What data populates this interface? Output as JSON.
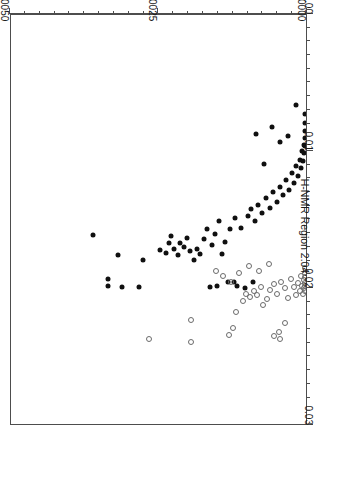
{
  "chart_data": {
    "type": "scatter",
    "title": "",
    "subtitle": "",
    "orientation_note": "figure printed rotated 180 degrees",
    "xlabel": "H-NMR Region 2.77",
    "ylabel": "H-NMR Region 2.04",
    "xlim": [
      0.0,
      0.005
    ],
    "ylim": [
      0.0,
      0.03
    ],
    "x_ticks": [
      0.0,
      0.0025,
      0.005
    ],
    "x_tick_labels": [
      "0.0000",
      "0.0025",
      "0.0050"
    ],
    "y_ticks": [
      0.0,
      0.01,
      0.02,
      0.03
    ],
    "y_tick_labels": [
      "0.00",
      "0.01",
      "0.02",
      "0.03"
    ],
    "x_minor_count": 9,
    "y_minor_count": 9,
    "grid": false,
    "legend": null,
    "series": [
      {
        "name": "filled-circles",
        "marker": "filled circle",
        "color": "#101010",
        "points": [
          [
            0.00333,
            0.0199
          ],
          [
            0.00333,
            0.0194
          ],
          [
            0.00309,
            0.02
          ],
          [
            0.00281,
            0.02
          ],
          [
            0.00161,
            0.02
          ],
          [
            0.00149,
            0.0199
          ],
          [
            0.00131,
            0.0196
          ],
          [
            0.00122,
            0.0196
          ],
          [
            0.00116,
            0.0199
          ],
          [
            0.00102,
            0.0201
          ],
          [
            0.0009,
            0.0196
          ],
          [
            0.00359,
            0.0162
          ],
          [
            0.00317,
            0.0177
          ],
          [
            0.00274,
            0.018
          ],
          [
            0.00246,
            0.0173
          ],
          [
            0.00235,
            0.0175
          ],
          [
            0.0023,
            0.0168
          ],
          [
            0.00228,
            0.0163
          ],
          [
            0.00223,
            0.0172
          ],
          [
            0.00216,
            0.0177
          ],
          [
            0.00212,
            0.0168
          ],
          [
            0.00205,
            0.0171
          ],
          [
            0.002,
            0.0164
          ],
          [
            0.00196,
            0.0174
          ],
          [
            0.00189,
            0.018
          ],
          [
            0.00184,
            0.0172
          ],
          [
            0.00179,
            0.0176
          ],
          [
            0.00172,
            0.0165
          ],
          [
            0.00166,
            0.0158
          ],
          [
            0.00158,
            0.0169
          ],
          [
            0.00154,
            0.0161
          ],
          [
            0.00146,
            0.0152
          ],
          [
            0.00141,
            0.0176
          ],
          [
            0.00136,
            0.0167
          ],
          [
            0.00128,
            0.0158
          ],
          [
            0.00119,
            0.015
          ],
          [
            0.0011,
            0.0157
          ],
          [
            0.00098,
            0.0148
          ],
          [
            0.00093,
            0.0143
          ],
          [
            0.00086,
            0.0152
          ],
          [
            0.0008,
            0.014
          ],
          [
            0.00074,
            0.0146
          ],
          [
            0.00068,
            0.0135
          ],
          [
            0.00061,
            0.0142
          ],
          [
            0.00055,
            0.0131
          ],
          [
            0.00049,
            0.0138
          ],
          [
            0.00043,
            0.0127
          ],
          [
            0.00038,
            0.0133
          ],
          [
            0.00033,
            0.0122
          ],
          [
            0.00029,
            0.0129
          ],
          [
            0.00024,
            0.0117
          ],
          [
            0.0002,
            0.0124
          ],
          [
            0.00016,
            0.0112
          ],
          [
            0.00013,
            0.0119
          ],
          [
            0.0001,
            0.0107
          ],
          [
            8e-05,
            0.0113
          ],
          [
            6e-05,
            0.0101
          ],
          [
            5e-05,
            0.0108
          ],
          [
            4e-05,
            0.0096
          ],
          [
            3e-05,
            0.0102
          ],
          [
            2e-05,
            0.0091
          ],
          [
            2e-05,
            0.0097
          ],
          [
            1e-05,
            0.0086
          ],
          [
            1e-05,
            0.008
          ],
          [
            1e-05,
            0.0074
          ],
          [
            0.00016,
            0.0067
          ],
          [
            0.00085,
            0.0088
          ],
          [
            0.00057,
            0.0083
          ],
          [
            0.00043,
            0.0094
          ],
          [
            0.0007,
            0.011
          ],
          [
            0.00031,
            0.009
          ]
        ]
      },
      {
        "name": "open-circles",
        "marker": "open circle",
        "color": "#6b6b6b",
        "points": [
          [
            0.00264,
            0.0238
          ],
          [
            0.00194,
            0.024
          ],
          [
            0.00194,
            0.0224
          ],
          [
            0.00129,
            0.0235
          ],
          [
            0.00123,
            0.023
          ],
          [
            0.00054,
            0.0236
          ],
          [
            0.00046,
            0.0233
          ],
          [
            0.00043,
            0.0238
          ],
          [
            0.00035,
            0.0226
          ],
          [
            0.00117,
            0.0218
          ],
          [
            0.00106,
            0.021
          ],
          [
            0.00101,
            0.0205
          ],
          [
            0.00095,
            0.0207
          ],
          [
            0.00088,
            0.0203
          ],
          [
            0.00082,
            0.0206
          ],
          [
            0.00076,
            0.02
          ],
          [
            0.00072,
            0.0213
          ],
          [
            0.00066,
            0.0209
          ],
          [
            0.0006,
            0.0202
          ],
          [
            0.00054,
            0.0198
          ],
          [
            0.00048,
            0.0205
          ],
          [
            0.00042,
            0.0196
          ],
          [
            0.00036,
            0.0201
          ],
          [
            0.0003,
            0.0208
          ],
          [
            0.00025,
            0.0194
          ],
          [
            0.00021,
            0.02
          ],
          [
            0.00017,
            0.0206
          ],
          [
            0.00013,
            0.0197
          ],
          [
            0.0001,
            0.0203
          ],
          [
            8e-05,
            0.0192
          ],
          [
            6e-05,
            0.0199
          ],
          [
            5e-05,
            0.0205
          ],
          [
            4e-05,
            0.0195
          ],
          [
            3e-05,
            0.0201
          ],
          [
            2e-05,
            0.019
          ],
          [
            2e-05,
            0.0197
          ],
          [
            1e-05,
            0.0203
          ],
          [
            1e-05,
            0.0186
          ],
          [
            1e-05,
            0.0193
          ],
          [
            1e-05,
            0.0199
          ],
          [
            0.00113,
            0.019
          ],
          [
            0.00096,
            0.0185
          ],
          [
            0.00079,
            0.0188
          ],
          [
            0.00062,
            0.0183
          ],
          [
            0.00126,
            0.0196
          ],
          [
            0.0014,
            0.0192
          ],
          [
            0.00151,
            0.0188
          ]
        ]
      }
    ]
  }
}
